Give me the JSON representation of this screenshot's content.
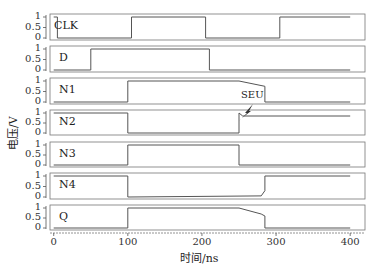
{
  "chart_data": {
    "type": "line",
    "title": "",
    "xlabel": "时间/ns",
    "ylabel": "电压/V",
    "xlim": [
      -5,
      420
    ],
    "x_ticks": [
      "0",
      "100",
      "200",
      "300",
      "400"
    ],
    "y_ticks": [
      "0",
      "0.5",
      "1"
    ],
    "ylim": [
      0,
      1.1
    ],
    "grid": false,
    "annotations": [
      {
        "text": "SEU",
        "x": 250,
        "panel": "N2",
        "note": "lightning strike at ~250ns"
      }
    ],
    "series": [
      {
        "name": "CLK",
        "x": [
          0,
          5,
          5,
          105,
          105,
          205,
          205,
          305,
          305,
          400
        ],
        "values": [
          1,
          1,
          0,
          0,
          1,
          1,
          0,
          0,
          1,
          1
        ]
      },
      {
        "name": "D",
        "x": [
          0,
          50,
          50,
          210,
          210,
          400
        ],
        "values": [
          0,
          0,
          1,
          1,
          0,
          0
        ]
      },
      {
        "name": "N1",
        "x": [
          0,
          100,
          100,
          250,
          285,
          285,
          400
        ],
        "values": [
          0,
          0,
          1,
          1,
          0.75,
          0,
          0
        ]
      },
      {
        "name": "N2",
        "x": [
          0,
          100,
          100,
          250,
          250,
          255,
          400
        ],
        "values": [
          1,
          1,
          0,
          0,
          1,
          0.85,
          0.85
        ]
      },
      {
        "name": "N3",
        "x": [
          0,
          100,
          100,
          250,
          250,
          400
        ],
        "values": [
          0,
          0,
          1,
          1,
          0,
          0
        ]
      },
      {
        "name": "N4",
        "x": [
          0,
          100,
          100,
          280,
          285,
          285,
          400
        ],
        "values": [
          1,
          1,
          0,
          0.05,
          0.3,
          1,
          1
        ]
      },
      {
        "name": "Q",
        "x": [
          0,
          100,
          100,
          250,
          280,
          285,
          285,
          400
        ],
        "values": [
          0,
          0,
          1,
          1,
          0.7,
          0.6,
          0,
          0
        ]
      }
    ]
  },
  "labels": {
    "ylabel": "电压/V",
    "xlabel": "时间/ns",
    "seu": "SEU",
    "panels": [
      "CLK",
      "D",
      "N1",
      "N2",
      "N3",
      "N4",
      "Q"
    ],
    "y_ticks": [
      "1",
      "0.5",
      "0"
    ],
    "x_ticks": [
      "0",
      "100",
      "200",
      "300",
      "400"
    ]
  }
}
